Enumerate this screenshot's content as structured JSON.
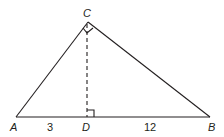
{
  "diagram": {
    "type": "right triangle with altitude",
    "points": {
      "A": {
        "label": "A",
        "x": 16,
        "y": 117
      },
      "B": {
        "label": "B",
        "x": 210,
        "y": 117
      },
      "C": {
        "label": "C",
        "x": 88,
        "y": 22
      },
      "D": {
        "label": "D",
        "x": 87,
        "y": 117
      }
    },
    "segments": {
      "AD": {
        "label": "3"
      },
      "DB": {
        "label": "12"
      }
    },
    "right_angles": [
      "ACB",
      "CDB"
    ],
    "altitude": "CD (dashed)"
  }
}
